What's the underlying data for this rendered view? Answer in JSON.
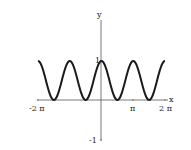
{
  "chart_data": {
    "type": "line",
    "title": "",
    "xlabel": "x",
    "ylabel": "y",
    "function": "cos^2(x)",
    "xlim": [
      -6.2832,
      6.2832
    ],
    "ylim": [
      -1,
      1
    ],
    "x_tick_labels": [
      "-2 π",
      "π",
      "2 π"
    ],
    "y_tick_labels": [
      "1",
      "-1"
    ],
    "grid": false,
    "legend": null,
    "series": [
      {
        "name": "y = cos²(x)",
        "x": [
          -6.2832,
          -4.7124,
          -3.1416,
          -1.5708,
          0,
          1.5708,
          3.1416,
          4.7124,
          6.2832
        ],
        "values": [
          1,
          0,
          1,
          0,
          1,
          0,
          1,
          0,
          1
        ]
      }
    ]
  },
  "axes": {
    "x_label": "x",
    "y_label": "y",
    "tick_neg2pi": "-2 π",
    "tick_pi": "π",
    "tick_2pi": "2 π",
    "tick_y1": "1",
    "tick_yneg1": "-1"
  },
  "style": {
    "curve_color": "#1a1a1a",
    "axis_color": "#555555"
  }
}
